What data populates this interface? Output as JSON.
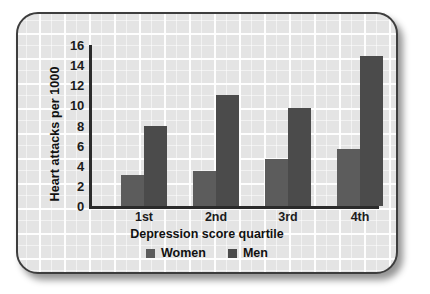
{
  "chart_data": {
    "type": "bar",
    "title": "",
    "xlabel": "Depression score quartile",
    "ylabel": "Heart attacks per 1000",
    "categories": [
      "1st",
      "2nd",
      "3rd",
      "4th"
    ],
    "series": [
      {
        "name": "Women",
        "color": "#5c5c5c",
        "values": [
          3.1,
          3.5,
          4.7,
          5.7
        ]
      },
      {
        "name": "Men",
        "color": "#4b4b4b",
        "values": [
          8.0,
          11.0,
          9.7,
          14.9
        ]
      }
    ],
    "ylim": [
      0,
      16
    ],
    "ytick_labels": [
      "16",
      "14",
      "12",
      "10",
      "8",
      "6",
      "4",
      "2",
      "0"
    ],
    "ytick_values": [
      16,
      14,
      12,
      10,
      8,
      6,
      4,
      2,
      0
    ],
    "grid": true,
    "legend_position": "bottom"
  },
  "legend": {
    "items": [
      {
        "label": "Women",
        "color": "#5c5c5c"
      },
      {
        "label": "Men",
        "color": "#4b4b4b"
      }
    ]
  }
}
